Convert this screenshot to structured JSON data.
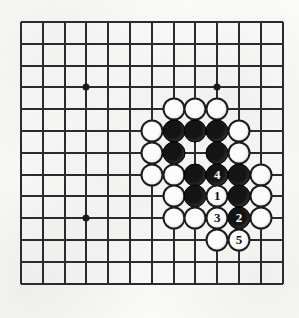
{
  "figure": {
    "board": {
      "visible_lines_horizontal": 13,
      "visible_lines_vertical": 13,
      "line_spacing_px": 21.8,
      "origin_x_px": 21,
      "origin_y_px": 22,
      "line_color": "#2b2b2b",
      "background_color": "#faf9f7"
    },
    "star_points": [
      {
        "name": "hoshi-upper-left",
        "col": 3,
        "row": 3
      },
      {
        "name": "hoshi-upper-right",
        "col": 9,
        "row": 3
      },
      {
        "name": "hoshi-lower-left",
        "col": 3,
        "row": 9
      }
    ],
    "colors": {
      "black_stone": "#141414",
      "white_stone": "#fcfcfc",
      "stone_outline": "#1d1d1d",
      "black_stone_label": "#ffffff",
      "white_stone_label": "#111111"
    },
    "stones": [
      {
        "id": "stone-c7r4",
        "color": "white",
        "col": 7,
        "row": 4,
        "label": ""
      },
      {
        "id": "stone-c8r4",
        "color": "white",
        "col": 8,
        "row": 4,
        "label": ""
      },
      {
        "id": "stone-c9r4",
        "color": "white",
        "col": 9,
        "row": 4,
        "label": ""
      },
      {
        "id": "stone-c6r5",
        "color": "white",
        "col": 6,
        "row": 5,
        "label": ""
      },
      {
        "id": "stone-c7r5",
        "color": "black",
        "col": 7,
        "row": 5,
        "label": ""
      },
      {
        "id": "stone-c8r5",
        "color": "black",
        "col": 8,
        "row": 5,
        "label": ""
      },
      {
        "id": "stone-c9r5",
        "color": "black",
        "col": 9,
        "row": 5,
        "label": ""
      },
      {
        "id": "stone-c10r5",
        "color": "white",
        "col": 10,
        "row": 5,
        "label": ""
      },
      {
        "id": "stone-c6r6",
        "color": "white",
        "col": 6,
        "row": 6,
        "label": ""
      },
      {
        "id": "stone-c7r6",
        "color": "black",
        "col": 7,
        "row": 6,
        "label": ""
      },
      {
        "id": "stone-c9r6",
        "color": "black",
        "col": 9,
        "row": 6,
        "label": ""
      },
      {
        "id": "stone-c10r6",
        "color": "white",
        "col": 10,
        "row": 6,
        "label": ""
      },
      {
        "id": "stone-c6r7",
        "color": "white",
        "col": 6,
        "row": 7,
        "label": ""
      },
      {
        "id": "stone-c7r7",
        "color": "white",
        "col": 7,
        "row": 7,
        "label": ""
      },
      {
        "id": "stone-c8r7",
        "color": "black",
        "col": 8,
        "row": 7,
        "label": ""
      },
      {
        "id": "stone-c9r7",
        "color": "black",
        "col": 9,
        "row": 7,
        "label": "4"
      },
      {
        "id": "stone-c10r7",
        "color": "black",
        "col": 10,
        "row": 7,
        "label": ""
      },
      {
        "id": "stone-c11r7",
        "color": "white",
        "col": 11,
        "row": 7,
        "label": ""
      },
      {
        "id": "stone-c7r8",
        "color": "white",
        "col": 7,
        "row": 8,
        "label": ""
      },
      {
        "id": "stone-c8r8",
        "color": "black",
        "col": 8,
        "row": 8,
        "label": ""
      },
      {
        "id": "stone-c9r8",
        "color": "white",
        "col": 9,
        "row": 8,
        "label": "1"
      },
      {
        "id": "stone-c10r8",
        "color": "black",
        "col": 10,
        "row": 8,
        "label": ""
      },
      {
        "id": "stone-c11r8",
        "color": "white",
        "col": 11,
        "row": 8,
        "label": ""
      },
      {
        "id": "stone-c7r9",
        "color": "white",
        "col": 7,
        "row": 9,
        "label": ""
      },
      {
        "id": "stone-c8r9",
        "color": "white",
        "col": 8,
        "row": 9,
        "label": ""
      },
      {
        "id": "stone-c9r9",
        "color": "white",
        "col": 9,
        "row": 9,
        "label": "3"
      },
      {
        "id": "stone-c10r9",
        "color": "black",
        "col": 10,
        "row": 9,
        "label": "2"
      },
      {
        "id": "stone-c11r9",
        "color": "white",
        "col": 11,
        "row": 9,
        "label": ""
      },
      {
        "id": "stone-c9r10",
        "color": "white",
        "col": 9,
        "row": 10,
        "label": ""
      },
      {
        "id": "stone-c10r10",
        "color": "white",
        "col": 10,
        "row": 10,
        "label": "5"
      }
    ],
    "move_sequence": [
      {
        "number": "1",
        "color": "white",
        "col": 9,
        "row": 8
      },
      {
        "number": "2",
        "color": "black",
        "col": 10,
        "row": 9
      },
      {
        "number": "3",
        "color": "white",
        "col": 9,
        "row": 9
      },
      {
        "number": "4",
        "color": "black",
        "col": 9,
        "row": 7
      },
      {
        "number": "5",
        "color": "white",
        "col": 10,
        "row": 10
      }
    ]
  }
}
